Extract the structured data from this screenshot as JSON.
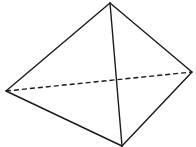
{
  "diagram": {
    "type": "tetrahedron",
    "stroke_color": "#1a1a1a",
    "background": "#ffffff",
    "vertices": {
      "top": [
        110,
        3
      ],
      "left": [
        6,
        91
      ],
      "right": [
        192,
        72
      ],
      "bottom": [
        122,
        146
      ]
    },
    "solid_edges": [
      [
        "top",
        "left"
      ],
      [
        "top",
        "right"
      ],
      [
        "top",
        "bottom"
      ],
      [
        "left",
        "bottom"
      ],
      [
        "right",
        "bottom"
      ]
    ],
    "dashed_edges": [
      [
        "left",
        "right"
      ]
    ]
  }
}
